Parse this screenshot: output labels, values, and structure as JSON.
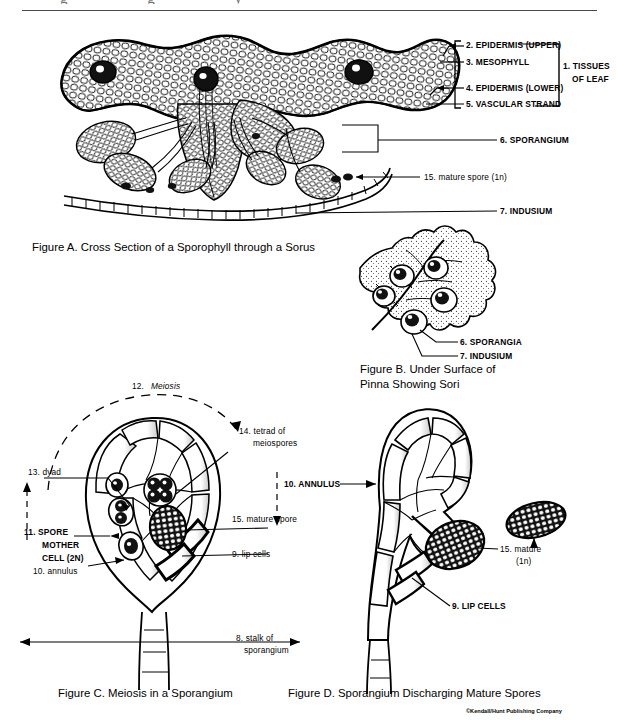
{
  "document": {
    "credit": "©Kendall/Hunt Publishing Company",
    "cut_off_header": "g      g      y"
  },
  "figure_a": {
    "caption": "Figure A. Cross Section of a Sporophyll through a Sorus",
    "labels": [
      {
        "id": "a-l2",
        "text": "2. EPIDERMIS (UPPER)"
      },
      {
        "id": "a-l3",
        "text": "3. MESOPHYLL"
      },
      {
        "id": "a-l4",
        "text": "4. EPIDERMIS (LOWER)"
      },
      {
        "id": "a-l5",
        "text": "5. VASCULAR STRAND"
      },
      {
        "id": "a-l1a",
        "text": "1. TISSUES"
      },
      {
        "id": "a-l1b",
        "text": "OF LEAF"
      },
      {
        "id": "a-l6",
        "text": "6. SPORANGIUM"
      },
      {
        "id": "a-l15",
        "text": "15. mature spore (1n)"
      },
      {
        "id": "a-l7",
        "text": "7. INDUSIUM"
      }
    ]
  },
  "figure_b": {
    "caption_line1": "Figure B. Under Surface of",
    "caption_line2": "Pinna Showing Sori",
    "labels": [
      {
        "id": "b-l6",
        "text": "6. SPORANGIA"
      },
      {
        "id": "b-l7",
        "text": "7. INDUSIUM"
      }
    ]
  },
  "figure_c": {
    "caption": "Figure C. Meiosis in a Sporangium",
    "labels": [
      {
        "id": "c-l12-num",
        "text": "12."
      },
      {
        "id": "c-l12-word",
        "text": "Meiosis"
      },
      {
        "id": "c-l14a",
        "text": "14. tetrad of"
      },
      {
        "id": "c-l14b",
        "text": "meiospores"
      },
      {
        "id": "c-l13",
        "text": "13. dyad"
      },
      {
        "id": "c-l11a",
        "text": "11. SPORE"
      },
      {
        "id": "c-l11b",
        "text": "MOTHER"
      },
      {
        "id": "c-l11c",
        "text": "CELL (2N)"
      },
      {
        "id": "c-l10",
        "text": "10. annulus"
      },
      {
        "id": "c-l15",
        "text": "15. mature spore"
      },
      {
        "id": "c-l9",
        "text": "9. lip cells"
      },
      {
        "id": "c-l8a",
        "text": "8. stalk of"
      },
      {
        "id": "c-l8b",
        "text": "sporangium"
      }
    ]
  },
  "figure_d": {
    "caption": "Figure D. Sporangium Discharging Mature Spores",
    "labels": [
      {
        "id": "d-l10",
        "text": "10. ANNULUS"
      },
      {
        "id": "d-l15a",
        "text": "15. mature"
      },
      {
        "id": "d-l15b",
        "text": "(1n)"
      },
      {
        "id": "d-l9",
        "text": "9. LIP CELLS"
      }
    ]
  },
  "colors": {
    "ink": "#000000",
    "rule": "#4a4a4a",
    "paper": "#ffffff",
    "shade": "#d8d8d8"
  }
}
